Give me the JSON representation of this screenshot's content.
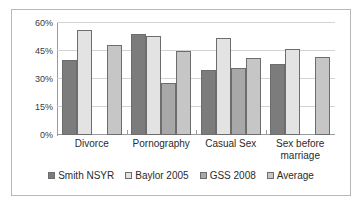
{
  "chart_data": {
    "type": "bar",
    "title": "",
    "subtitle": "",
    "xlabel": "",
    "ylabel": "",
    "ylim": [
      0,
      60
    ],
    "ytick_labels": [
      "0%",
      "15%",
      "30%",
      "45%",
      "60%"
    ],
    "ytick_values": [
      0,
      15,
      30,
      45,
      60
    ],
    "grid": true,
    "legend_position": "bottom",
    "categories": [
      "Divorce",
      "Pornography",
      "Casual Sex",
      "Sex before marriage"
    ],
    "series": [
      {
        "name": "Smith NSYR",
        "color": "#7c7c7c",
        "values": [
          40,
          54,
          35,
          38
        ]
      },
      {
        "name": "Baylor 2005",
        "color": "#e3e3e3",
        "values": [
          56,
          53,
          52,
          46
        ]
      },
      {
        "name": "GSS 2008",
        "color": "#a8a8a8",
        "values": [
          null,
          28,
          36,
          null
        ]
      },
      {
        "name": "Average",
        "color": "#c6c6c6",
        "values": [
          48,
          45,
          41,
          42
        ]
      }
    ]
  }
}
